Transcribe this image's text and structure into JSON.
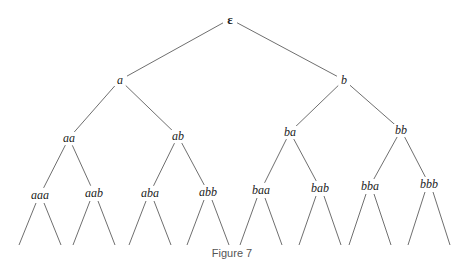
{
  "diagram": {
    "type": "binary-tree",
    "edge_color": "#6f6f6f",
    "nodes": [
      {
        "id": "root",
        "label": "ε",
        "x": 230,
        "y": 19,
        "root": true
      },
      {
        "id": "a",
        "label": "a",
        "x": 120,
        "y": 80,
        "parent": "root"
      },
      {
        "id": "b",
        "label": "b",
        "x": 344,
        "y": 80,
        "parent": "root"
      },
      {
        "id": "aa",
        "label": "aa",
        "x": 69,
        "y": 138,
        "parent": "a"
      },
      {
        "id": "ab",
        "label": "ab",
        "x": 178,
        "y": 136,
        "parent": "a"
      },
      {
        "id": "ba",
        "label": "ba",
        "x": 290,
        "y": 132,
        "parent": "b"
      },
      {
        "id": "bb",
        "label": "bb",
        "x": 401,
        "y": 130,
        "parent": "b"
      },
      {
        "id": "aaa",
        "label": "aaa",
        "x": 40,
        "y": 195,
        "parent": "aa"
      },
      {
        "id": "aab",
        "label": "aab",
        "x": 94,
        "y": 193,
        "parent": "aa"
      },
      {
        "id": "aba",
        "label": "aba",
        "x": 150,
        "y": 193,
        "parent": "ab"
      },
      {
        "id": "abb",
        "label": "abb",
        "x": 208,
        "y": 192,
        "parent": "ab"
      },
      {
        "id": "baa",
        "label": "baa",
        "x": 261,
        "y": 190,
        "parent": "ba"
      },
      {
        "id": "bab",
        "label": "bab",
        "x": 320,
        "y": 188,
        "parent": "ba"
      },
      {
        "id": "bba",
        "label": "bba",
        "x": 370,
        "y": 186,
        "parent": "bb"
      },
      {
        "id": "bbb",
        "label": "bbb",
        "x": 429,
        "y": 184,
        "parent": "bb"
      }
    ],
    "leaf_stub": {
      "dx": 21,
      "end_y": 245
    }
  },
  "caption": "Figure 7"
}
